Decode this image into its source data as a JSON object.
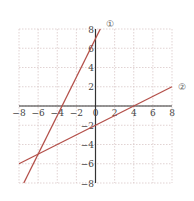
{
  "chart_data": {
    "type": "line",
    "title": "",
    "xlabel": "",
    "ylabel": "",
    "xlim": [
      -8,
      8
    ],
    "ylim": [
      -8,
      8
    ],
    "grid": true,
    "x_ticks": [
      -8,
      -6,
      -4,
      -2,
      0,
      2,
      4,
      6,
      8
    ],
    "y_ticks": [
      -8,
      -6,
      -4,
      -2,
      0,
      2,
      4,
      6,
      8
    ],
    "x_tick_labels": [
      "−8",
      "−6",
      "−4",
      "−2",
      "0",
      "2",
      "4",
      "6",
      "8"
    ],
    "y_tick_labels": [
      "−8",
      "−6",
      "−4",
      "−2",
      "0",
      "2",
      "4",
      "6",
      "8"
    ],
    "series": [
      {
        "name": "①",
        "equation": "y = 2x + 7",
        "points": [
          [
            -7.5,
            -8
          ],
          [
            0.5,
            8
          ]
        ],
        "color": "#b4504a"
      },
      {
        "name": "②",
        "equation": "y = x/2 − 2",
        "points": [
          [
            -8,
            -6
          ],
          [
            8,
            2
          ]
        ],
        "color": "#b4504a"
      }
    ],
    "intersections": [
      [
        -6,
        -5
      ]
    ],
    "legend_position": "line-end labels"
  },
  "colors": {
    "line": "#b4504a",
    "axis": "#333333",
    "grid": "#d9c8c8"
  }
}
